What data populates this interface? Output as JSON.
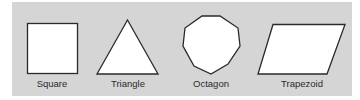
{
  "figure": {
    "background_color": "#d5d5d5",
    "shape_fill": "#ffffff",
    "shape_stroke": "#2a2a2a",
    "shapes": [
      {
        "name": "Square",
        "label": "Square"
      },
      {
        "name": "Triangle",
        "label": "Triangle"
      },
      {
        "name": "Octagon",
        "label": "Octagon"
      },
      {
        "name": "Trapezoid",
        "label": "Trapezoid"
      }
    ]
  }
}
